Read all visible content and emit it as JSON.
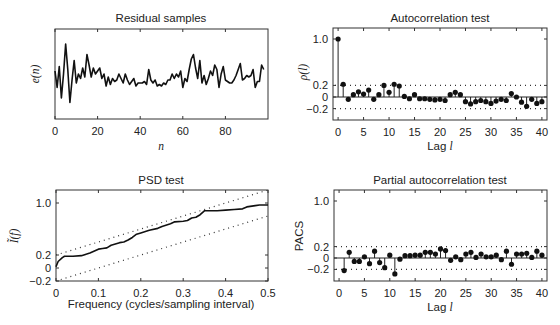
{
  "chart_data": [
    {
      "id": "residual",
      "type": "line",
      "title": "Residual samples",
      "xlabel": "n",
      "ylabel": "e(n)",
      "xticks": [
        0,
        20,
        40,
        60,
        80
      ],
      "xlim": [
        0,
        100
      ],
      "ylim": [
        -3,
        3
      ],
      "yticks": [],
      "grid": false,
      "x": [
        0,
        1,
        2,
        3,
        4,
        5,
        6,
        7,
        8,
        9,
        10,
        11,
        12,
        13,
        14,
        15,
        16,
        17,
        18,
        19,
        20,
        21,
        22,
        23,
        24,
        25,
        26,
        27,
        28,
        29,
        30,
        31,
        32,
        33,
        34,
        35,
        36,
        37,
        38,
        39,
        40,
        41,
        42,
        43,
        44,
        45,
        46,
        47,
        48,
        49,
        50,
        51,
        52,
        53,
        54,
        55,
        56,
        57,
        58,
        59,
        60,
        61,
        62,
        63,
        64,
        65,
        66,
        67,
        68,
        69,
        70,
        71,
        72,
        73,
        74,
        75,
        76,
        77,
        78,
        79,
        80,
        81,
        82,
        83,
        84,
        85,
        86,
        87,
        88,
        89,
        90,
        91,
        92,
        93,
        94,
        95,
        96,
        97,
        98
      ],
      "values": [
        0.2,
        -0.9,
        0.5,
        -1.6,
        0.0,
        2.0,
        0.3,
        -1.9,
        -0.4,
        0.9,
        -0.6,
        0.0,
        -0.3,
        0.4,
        -0.2,
        1.3,
        0.6,
        -0.2,
        0.4,
        0.0,
        0.2,
        0.4,
        -0.3,
        0.0,
        -0.8,
        -0.2,
        -0.7,
        -0.3,
        -0.5,
        -0.4,
        0.0,
        -0.3,
        -0.6,
        0.0,
        -0.4,
        -0.7,
        -0.5,
        -0.3,
        -0.8,
        -0.6,
        -0.6,
        -0.6,
        -0.5,
        -0.7,
        0.3,
        -0.4,
        -0.6,
        -0.4,
        -0.8,
        -0.7,
        -0.8,
        -0.6,
        -0.7,
        -0.4,
        -0.4,
        0.0,
        -0.3,
        0.0,
        -0.2,
        0.2,
        -0.9,
        -0.3,
        -0.5,
        0.3,
        1.0,
        1.3,
        0.4,
        -0.3,
        0.9,
        -0.6,
        -0.1,
        -0.7,
        -0.3,
        0.2,
        -0.1,
        0.6,
        0.3,
        -0.9,
        0.0,
        0.5,
        -0.4,
        -0.5,
        -0.6,
        -0.6,
        -0.4,
        -0.1,
        0.3,
        0.7,
        -0.4,
        -0.3,
        -0.1,
        -0.2,
        -0.1,
        0.3,
        -0.9,
        -0.5,
        -0.5,
        0.6,
        0.3,
        1.8
      ]
    },
    {
      "id": "autocorrelation",
      "type": "stem",
      "title": "Autocorrelation test",
      "xlabel": "Lag l",
      "ylabel": "ρ(l)",
      "xticks": [
        0,
        5,
        10,
        15,
        20,
        25,
        30,
        35,
        40
      ],
      "yticks": [
        -0.2,
        0,
        0.2,
        1.0
      ],
      "ytick_labels": [
        "-0.2",
        "0",
        "0.2",
        "1.0"
      ],
      "xlim": [
        -1,
        41
      ],
      "ylim": [
        -0.38,
        1.12
      ],
      "confidence_bounds": [
        0.2,
        -0.2
      ],
      "lags": [
        0,
        1,
        2,
        3,
        4,
        5,
        6,
        7,
        8,
        9,
        10,
        11,
        12,
        13,
        14,
        15,
        16,
        17,
        18,
        19,
        20,
        21,
        22,
        23,
        24,
        25,
        26,
        27,
        28,
        29,
        30,
        31,
        32,
        33,
        34,
        35,
        36,
        37,
        38,
        39,
        40
      ],
      "values": [
        1.0,
        0.22,
        -0.04,
        0.04,
        0.09,
        0.05,
        0.12,
        -0.04,
        0.04,
        0.2,
        0.08,
        0.22,
        0.19,
        0.01,
        -0.03,
        0.04,
        -0.03,
        -0.03,
        -0.04,
        -0.05,
        -0.04,
        -0.06,
        0.04,
        0.08,
        0.04,
        -0.08,
        -0.12,
        -0.08,
        -0.06,
        -0.08,
        -0.11,
        -0.07,
        -0.04,
        -0.06,
        0.06,
        0.0,
        -0.09,
        -0.16,
        -0.04,
        -0.11,
        -0.08
      ]
    },
    {
      "id": "psd",
      "type": "line",
      "title": "PSD test",
      "xlabel": "Frequency (cycles/sampling interval)",
      "ylabel": "Ĩ(f)",
      "xticks": [
        0,
        0.1,
        0.2,
        0.3,
        0.4,
        0.5
      ],
      "yticks": [
        -0.2,
        0,
        0.2,
        1.0
      ],
      "ytick_labels": [
        "-0.2",
        "0",
        "0.2",
        "1.0"
      ],
      "xlim": [
        0,
        0.5
      ],
      "ylim": [
        -0.2,
        1.2
      ],
      "bounds": {
        "upper": {
          "x": [
            0,
            0.5
          ],
          "y": [
            0.2,
            1.2
          ]
        },
        "lower": {
          "x": [
            0,
            0.5
          ],
          "y": [
            -0.2,
            0.8
          ]
        }
      },
      "x": [
        0,
        0.005,
        0.015,
        0.02,
        0.04,
        0.06,
        0.08,
        0.1,
        0.11,
        0.12,
        0.13,
        0.15,
        0.16,
        0.17,
        0.18,
        0.19,
        0.2,
        0.22,
        0.24,
        0.25,
        0.27,
        0.28,
        0.3,
        0.31,
        0.32,
        0.33,
        0.34,
        0.35,
        0.36,
        0.38,
        0.4,
        0.42,
        0.44,
        0.45,
        0.47,
        0.48,
        0.5
      ],
      "values": [
        0.02,
        0.1,
        0.16,
        0.18,
        0.18,
        0.19,
        0.23,
        0.29,
        0.3,
        0.31,
        0.35,
        0.39,
        0.4,
        0.43,
        0.47,
        0.52,
        0.54,
        0.58,
        0.61,
        0.64,
        0.68,
        0.71,
        0.72,
        0.73,
        0.77,
        0.78,
        0.82,
        0.88,
        0.88,
        0.88,
        0.89,
        0.9,
        0.91,
        0.94,
        0.96,
        0.97,
        0.97
      ]
    },
    {
      "id": "pacs",
      "type": "stem",
      "title": "Partial autocorrelation test",
      "xlabel": "Lag l",
      "ylabel": "PACS",
      "xticks": [
        0,
        5,
        10,
        15,
        20,
        25,
        30,
        35,
        40
      ],
      "yticks": [
        -0.2,
        0,
        0.2,
        1.0
      ],
      "ytick_labels": [
        "-0.2",
        "0",
        "0.2",
        "1.0"
      ],
      "xlim": [
        -1,
        41
      ],
      "ylim": [
        -0.38,
        1.12
      ],
      "confidence_bounds": [
        0.2,
        -0.2
      ],
      "lags": [
        1,
        2,
        3,
        4,
        5,
        6,
        7,
        8,
        9,
        10,
        11,
        12,
        13,
        14,
        15,
        16,
        17,
        18,
        19,
        20,
        21,
        22,
        23,
        24,
        25,
        26,
        27,
        28,
        29,
        30,
        31,
        32,
        33,
        34,
        35,
        36,
        37,
        38,
        39,
        40
      ],
      "values": [
        -0.22,
        0.1,
        -0.06,
        -0.06,
        0.02,
        -0.1,
        0.12,
        -0.08,
        -0.17,
        0.05,
        -0.28,
        -0.02,
        0.04,
        0.04,
        0.05,
        0.05,
        0.1,
        0.1,
        0.07,
        0.16,
        0.13,
        -0.04,
        0.02,
        -0.03,
        0.07,
        0.1,
        0.01,
        0.07,
        0.02,
        0.02,
        0.05,
        -0.03,
        0.12,
        -0.11,
        0.07,
        0.07,
        0.08,
        0.01,
        0.12,
        0.05
      ]
    }
  ]
}
